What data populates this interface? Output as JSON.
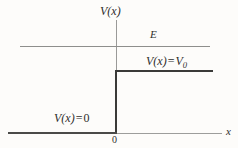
{
  "figure": {
    "background_color": "#fdfcfa",
    "line_color_thin": "#9a9a98",
    "line_color_thick": "#3a3a38",
    "text_color": "#2e2e2c"
  },
  "labels": {
    "y_axis": "V(x)",
    "x_axis": "x",
    "energy_level": "E",
    "potential_high_var": "V(x)",
    "potential_high_equals": "=",
    "potential_high_value": "V",
    "potential_high_subscript": "0",
    "potential_low_var": "V(x)",
    "potential_low_equals": "=",
    "potential_low_value": "0",
    "origin": "0"
  },
  "chart_data": {
    "type": "line",
    "xlabel": "x",
    "ylabel": "V(x)",
    "xlim": [
      -1.0,
      1.0
    ],
    "ylim": [
      0,
      1.0
    ],
    "grid": false,
    "legend_position": "none",
    "series": [
      {
        "name": "V(x) = 0",
        "label": "V(x) = 0",
        "x": [
          -1.0,
          0.0
        ],
        "y": [
          0,
          0
        ],
        "style": "thick",
        "color": "#4a4a48"
      },
      {
        "name": "V(x) = V_0",
        "label": "V(x) = V0",
        "x": [
          0.0,
          0.0,
          0.9
        ],
        "y": [
          0,
          0.55,
          0.55
        ],
        "style": "thick",
        "color": "#3a3a38"
      },
      {
        "name": "E",
        "label": "E",
        "x": [
          -0.9,
          0.88
        ],
        "y": [
          0.77,
          0.77
        ],
        "style": "thin",
        "color": "#8e8e8c"
      }
    ],
    "annotations": [
      {
        "text": "V(x)",
        "x": 0.0,
        "y": 1.0,
        "role": "y-axis-label"
      },
      {
        "text": "E",
        "x": 0.33,
        "y": 0.84,
        "role": "energy-level-label"
      },
      {
        "text": "V(x) = V0",
        "x": 0.31,
        "y": 0.63,
        "role": "step-potential-label"
      },
      {
        "text": "V(x) = 0",
        "x": -0.55,
        "y": 0.14,
        "role": "zero-potential-label"
      },
      {
        "text": "0",
        "x": 0.0,
        "y": -0.05,
        "role": "origin-tick-label"
      },
      {
        "text": "x",
        "x": 1.0,
        "y": 0.0,
        "role": "x-axis-label"
      }
    ]
  }
}
